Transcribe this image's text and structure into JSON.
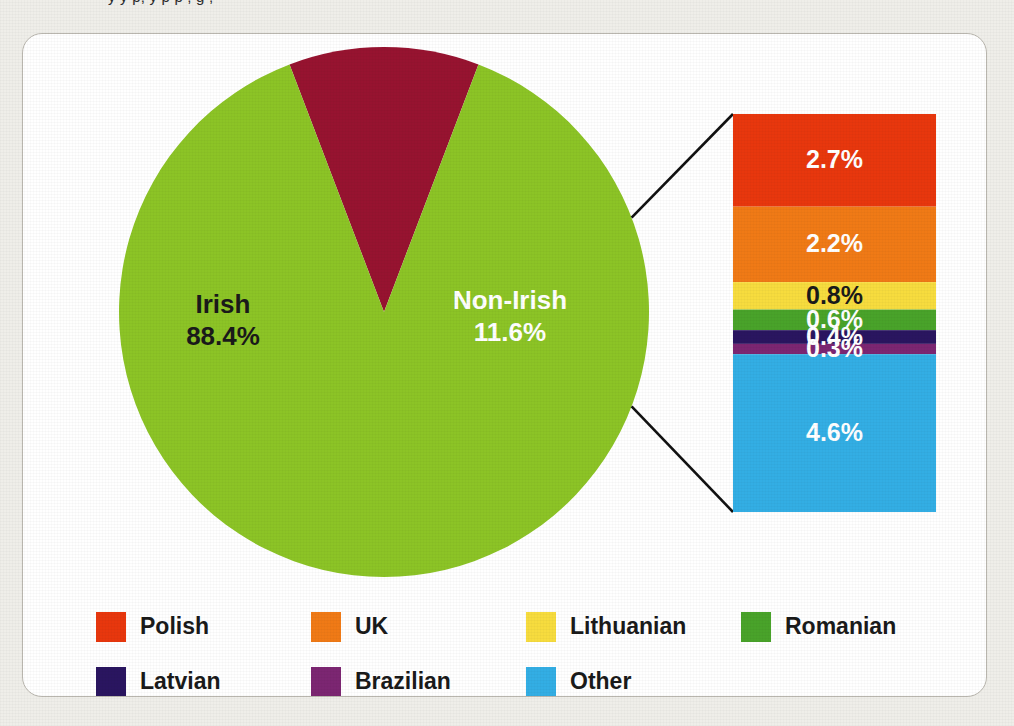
{
  "page": {
    "cut_off_caption": "y y p, y p p , g ,"
  },
  "chart_data": {
    "type": "pie",
    "title": "",
    "subtitle": "",
    "xlabel": "",
    "ylabel": "",
    "legend_position": "bottom",
    "grid": false,
    "pie": {
      "categories": [
        "Irish",
        "Non-Irish"
      ],
      "values": [
        88.4,
        11.6
      ],
      "labels": [
        "Irish\n88.4%",
        "Non-Irish\n11.6%"
      ],
      "slices": [
        {
          "name": "Irish",
          "value": 88.4,
          "value_label": "88.4%",
          "color": "#8cc426",
          "text_color": "#1a1a1a"
        },
        {
          "name": "Non-Irish",
          "value": 11.6,
          "value_label": "11.6%",
          "color": "#971330",
          "text_color": "#ffffff"
        }
      ]
    },
    "breakout_bar": {
      "type": "stacked_bar",
      "of_slice": "Non-Irish",
      "categories": [
        "Polish",
        "UK",
        "Lithuanian",
        "Romanian",
        "Latvian",
        "Brazilian",
        "Other"
      ],
      "values": [
        2.7,
        2.2,
        0.8,
        0.6,
        0.4,
        0.3,
        4.6
      ],
      "segments": [
        {
          "name": "Polish",
          "value": 2.7,
          "value_label": "2.7%",
          "color": "#e8370d",
          "text_color": "#ffffff"
        },
        {
          "name": "UK",
          "value": 2.2,
          "value_label": "2.2%",
          "color": "#f07a16",
          "text_color": "#ffffff"
        },
        {
          "name": "Lithuanian",
          "value": 0.8,
          "value_label": "0.8%",
          "color": "#f7dc3e",
          "text_color": "#1a1a1a"
        },
        {
          "name": "Romanian",
          "value": 0.6,
          "value_label": "0.6%",
          "color": "#49a32a",
          "text_color": "#ffffff"
        },
        {
          "name": "Latvian",
          "value": 0.4,
          "value_label": "0.4%",
          "color": "#2a1560",
          "text_color": "#ffffff"
        },
        {
          "name": "Brazilian",
          "value": 0.3,
          "value_label": "0.3%",
          "color": "#7c2672",
          "text_color": "#ffffff"
        },
        {
          "name": "Other",
          "value": 4.6,
          "value_label": "4.6%",
          "color": "#33aee4",
          "text_color": "#ffffff"
        }
      ]
    },
    "legend": [
      {
        "label": "Polish",
        "color": "#e8370d"
      },
      {
        "label": "UK",
        "color": "#f07a16"
      },
      {
        "label": "Lithuanian",
        "color": "#f7dc3e"
      },
      {
        "label": "Romanian",
        "color": "#49a32a"
      },
      {
        "label": "Latvian",
        "color": "#2a1560"
      },
      {
        "label": "Brazilian",
        "color": "#7c2672"
      },
      {
        "label": "Other",
        "color": "#33aee4"
      }
    ]
  },
  "colors": {
    "page_background": "#efeee9",
    "card_background": "#ffffff",
    "card_border": "#b9b6ae",
    "leader_line": "#111111"
  }
}
